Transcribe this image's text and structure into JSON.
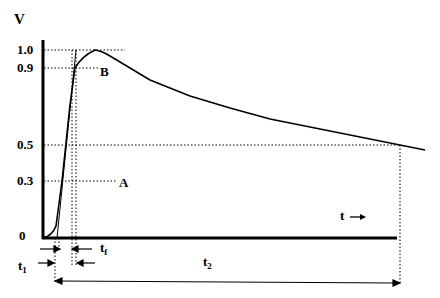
{
  "diagram": {
    "y_axis_label": "V",
    "x_axis_label": "t",
    "x_axis_arrow": "→",
    "y_ticks": [
      {
        "label": "1.0",
        "value": 1.0
      },
      {
        "label": "0.9",
        "value": 0.9
      },
      {
        "label": "0.5",
        "value": 0.5
      },
      {
        "label": "0.3",
        "value": 0.3
      },
      {
        "label": "0",
        "value": 0
      }
    ],
    "points": {
      "A": {
        "label": "A",
        "level": 0.3
      },
      "B": {
        "label": "B",
        "level": 0.9
      }
    },
    "intervals": {
      "t1": {
        "label": "t",
        "sub": "1"
      },
      "tf": {
        "label": "t",
        "sub": "f"
      },
      "t2": {
        "label": "t",
        "sub": "2"
      }
    },
    "colors": {
      "line": "#000000",
      "background": "#ffffff"
    }
  }
}
